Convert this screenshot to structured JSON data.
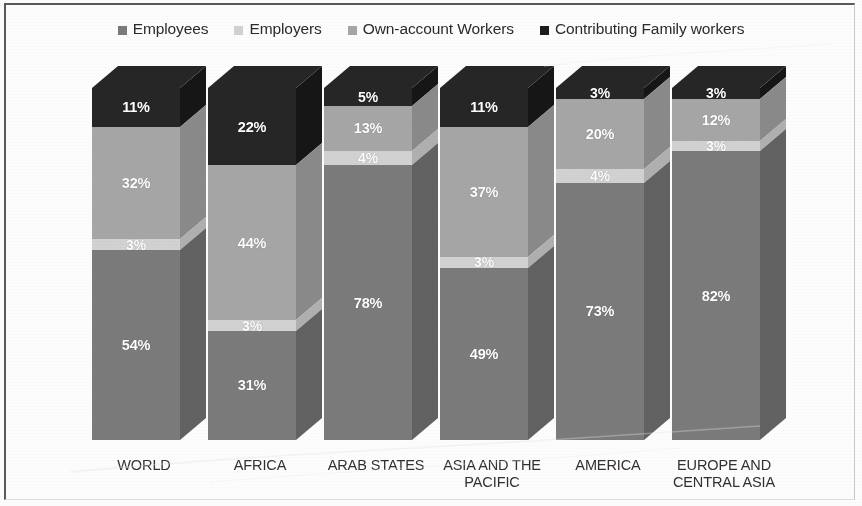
{
  "chart_data": {
    "type": "bar",
    "subtype": "100% stacked column (3D)",
    "title": "",
    "subtitle": "",
    "xlabel": "",
    "ylabel": "",
    "ylim": [
      0,
      100
    ],
    "grid": false,
    "legend_position": "top-center",
    "value_suffix": "%",
    "categories": [
      "WORLD",
      "AFRICA",
      "ARAB STATES",
      "ASIA AND THE PACIFIC",
      "AMERICA",
      "EUROPE AND CENTRAL ASIA"
    ],
    "category_lines": [
      [
        "WORLD"
      ],
      [
        "AFRICA"
      ],
      [
        "ARAB STATES"
      ],
      [
        "ASIA AND THE",
        "PACIFIC"
      ],
      [
        "AMERICA"
      ],
      [
        "EUROPE AND",
        "CENTRAL ASIA"
      ]
    ],
    "series": [
      {
        "name": "Employees",
        "color": "#7b7b7b",
        "side_color": "#626262",
        "values": [
          54,
          31,
          78,
          49,
          73,
          82
        ],
        "labels": [
          "54%",
          "31%",
          "78%",
          "49%",
          "73%",
          "82%"
        ]
      },
      {
        "name": "Employers",
        "color": "#d2d2d2",
        "side_color": "#b0b0b0",
        "values": [
          3,
          3,
          4,
          3,
          4,
          3
        ],
        "labels": [
          "3%",
          "3%",
          "4%",
          "3%",
          "4%",
          "3%"
        ]
      },
      {
        "name": "Own-account Workers",
        "color": "#a6a6a6",
        "side_color": "#8a8a8a",
        "values": [
          32,
          44,
          13,
          37,
          20,
          12
        ],
        "labels": [
          "32%",
          "44%",
          "13%",
          "37%",
          "20%",
          "12%"
        ]
      },
      {
        "name": "Contributing Family workers",
        "color": "#262626",
        "side_color": "#161616",
        "values": [
          11,
          22,
          5,
          11,
          3,
          3
        ],
        "labels": [
          "11%",
          "22%",
          "5%",
          "11%",
          "3%",
          "3%"
        ]
      }
    ]
  },
  "legend": {
    "items": [
      {
        "label": "Employees",
        "color": "#7b7b7b"
      },
      {
        "label": "Employers",
        "color": "#d2d2d2"
      },
      {
        "label": "Own-account Workers",
        "color": "#a6a6a6"
      },
      {
        "label": "Contributing Family workers",
        "color": "#1d1d1d"
      }
    ]
  },
  "frame": {
    "border_color": "#5a5a5a",
    "background": "#fdfdfd"
  }
}
